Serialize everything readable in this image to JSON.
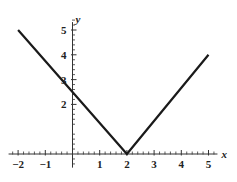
{
  "chart_data": {
    "type": "line",
    "title": "",
    "xlabel": "x",
    "ylabel": "y",
    "xlim": [
      -2.35,
      5.55
    ],
    "ylim": [
      -0.55,
      5.4
    ],
    "grid": false,
    "legend": null,
    "x_major_ticks": [
      -2,
      -1,
      1,
      2,
      3,
      4,
      5
    ],
    "x_tick_labels": [
      "−2",
      "−1",
      "1",
      "2",
      "3",
      "4",
      "5"
    ],
    "y_major_ticks": [
      2,
      3,
      4,
      5
    ],
    "y_tick_labels": [
      "2",
      "3",
      "4",
      "5"
    ],
    "x_minor_step": 0.2,
    "y_minor_step": 0.2,
    "series": [
      {
        "name": "y = |x - 2|",
        "x": [
          -2,
          2,
          5
        ],
        "y": [
          5,
          0,
          4
        ],
        "color": "#1a1a1a",
        "linewidth": 2.2
      }
    ],
    "annotations": {
      "vertex": {
        "x": 2,
        "y": 0
      },
      "y_intercept": {
        "x": 0,
        "y": 3
      }
    }
  },
  "axes": {
    "x_axis_label": "x",
    "y_axis_label": "y"
  },
  "ticks": {
    "x": [
      {
        "value": -2,
        "label": "−2"
      },
      {
        "value": -1,
        "label": "−1"
      },
      {
        "value": 1,
        "label": "1"
      },
      {
        "value": 2,
        "label": "2"
      },
      {
        "value": 3,
        "label": "3"
      },
      {
        "value": 4,
        "label": "4"
      },
      {
        "value": 5,
        "label": "5"
      }
    ],
    "y": [
      {
        "value": 2,
        "label": "2"
      },
      {
        "value": 3,
        "label": "3"
      },
      {
        "value": 4,
        "label": "4"
      },
      {
        "value": 5,
        "label": "5"
      }
    ]
  },
  "style": {
    "background": "#ffffff",
    "axis_color": "#333333",
    "curve_color": "#1a1a1a",
    "text_color": "#222222"
  }
}
